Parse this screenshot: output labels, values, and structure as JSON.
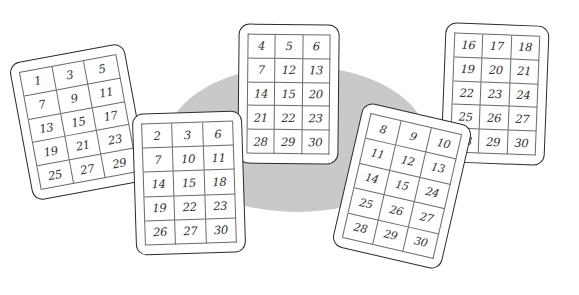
{
  "scene": {
    "title": "Five number cards over a gray oval",
    "background_color": "#ffffff",
    "ellipse_color": "#c9c9c9",
    "card_fill": "#ffffff",
    "card_border_color": "#2b2b2b",
    "grid_line_color": "#6a6a6a",
    "number_color": "#2f2f2f"
  },
  "cards": [
    {
      "id": "card-1",
      "name": "card-odd-numbers",
      "rotation_deg": -10.5,
      "rows": [
        [
          "1",
          "3",
          "5"
        ],
        [
          "7",
          "9",
          "11"
        ],
        [
          "13",
          "15",
          "17"
        ],
        [
          "19",
          "21",
          "23"
        ],
        [
          "25",
          "27",
          "29"
        ]
      ]
    },
    {
      "id": "card-2",
      "name": "card-two",
      "rotation_deg": -1.8,
      "rows": [
        [
          "2",
          "3",
          "6"
        ],
        [
          "7",
          "10",
          "11"
        ],
        [
          "14",
          "15",
          "18"
        ],
        [
          "19",
          "22",
          "23"
        ],
        [
          "26",
          "27",
          "30"
        ]
      ]
    },
    {
      "id": "card-3",
      "name": "card-three",
      "rotation_deg": 0.6,
      "rows": [
        [
          "4",
          "5",
          "6"
        ],
        [
          "7",
          "12",
          "13"
        ],
        [
          "14",
          "15",
          "20"
        ],
        [
          "21",
          "22",
          "23"
        ],
        [
          "28",
          "29",
          "30"
        ]
      ]
    },
    {
      "id": "card-4",
      "name": "card-four",
      "rotation_deg": 13,
      "rows": [
        [
          "8",
          "9",
          "10"
        ],
        [
          "11",
          "12",
          "13"
        ],
        [
          "14",
          "15",
          "24"
        ],
        [
          "25",
          "26",
          "27"
        ],
        [
          "28",
          "29",
          "30"
        ]
      ]
    },
    {
      "id": "card-5",
      "name": "card-five",
      "rotation_deg": 2.2,
      "rows": [
        [
          "16",
          "17",
          "18"
        ],
        [
          "19",
          "20",
          "21"
        ],
        [
          "22",
          "23",
          "24"
        ],
        [
          "25",
          "26",
          "27"
        ],
        [
          "28",
          "29",
          "30"
        ]
      ]
    }
  ]
}
